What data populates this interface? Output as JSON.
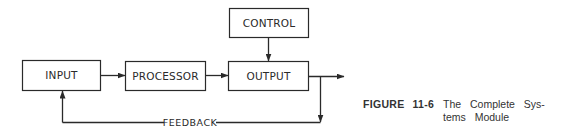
{
  "diagram": {
    "boxes": {
      "input": "INPUT",
      "processor": "PROCESSOR",
      "output": "OUTPUT",
      "control": "CONTROL"
    },
    "feedback_label": "FEEDBACK",
    "colors": {
      "line": "#2a2a2a",
      "background": "#ffffff"
    }
  },
  "caption": {
    "figure_word": "FIGURE",
    "figure_number": "11-6",
    "title_line1": "The Complete Sys-",
    "title_line2": "tems Module"
  }
}
